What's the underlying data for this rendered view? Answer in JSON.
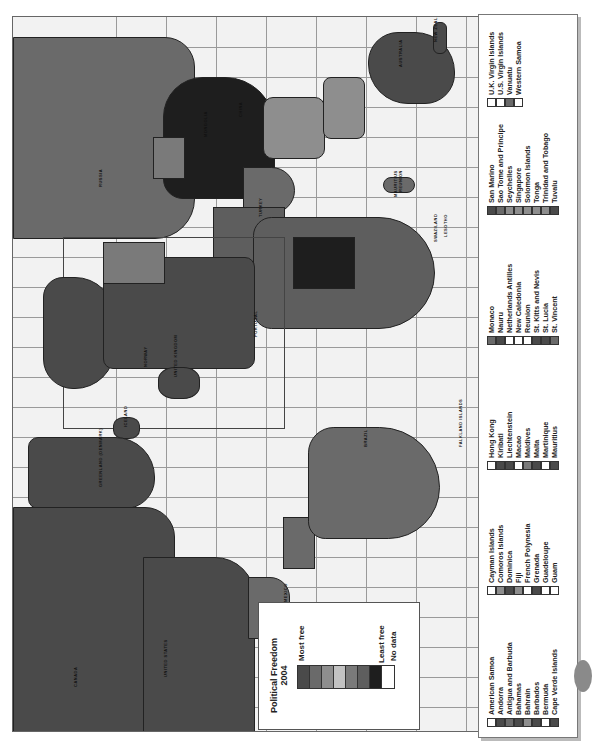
{
  "legend": {
    "title_line1": "Political Freedom",
    "title_line2": "2004",
    "most_free": "Most free",
    "least_free": "Least free",
    "no_data": "No data",
    "scale_colors": [
      "#4a4a4a",
      "#6a6a6a",
      "#8e8e8e",
      "#c2c2c2",
      "#7a7a7a",
      "#5e5e5e",
      "#1e1e1e",
      "#ffffff"
    ]
  },
  "map_labels": [
    {
      "text": "CANADA",
      "x": 60,
      "y": 670
    },
    {
      "text": "UNITED STATES",
      "x": 150,
      "y": 660
    },
    {
      "text": "GREENLAND (DENMARK)",
      "x": 85,
      "y": 470
    },
    {
      "text": "ICELAND",
      "x": 110,
      "y": 410
    },
    {
      "text": "NORWAY",
      "x": 130,
      "y": 350
    },
    {
      "text": "UNITED KINGDOM",
      "x": 160,
      "y": 360
    },
    {
      "text": "PORTUGAL",
      "x": 240,
      "y": 320
    },
    {
      "text": "TURKEY",
      "x": 245,
      "y": 200
    },
    {
      "text": "RUSSIA",
      "x": 85,
      "y": 170
    },
    {
      "text": "CHINA",
      "x": 225,
      "y": 100
    },
    {
      "text": "MONGOLIA",
      "x": 190,
      "y": 120
    },
    {
      "text": "AUSTRALIA",
      "x": 385,
      "y": 50
    },
    {
      "text": "NEW ZEALAND",
      "x": 420,
      "y": 25
    },
    {
      "text": "BRAZIL",
      "x": 350,
      "y": 430
    },
    {
      "text": "MEXICO",
      "x": 270,
      "y": 585
    },
    {
      "text": "FALKLAND ISLANDS",
      "x": 445,
      "y": 430
    },
    {
      "text": "MAURITIUS",
      "x": 380,
      "y": 180
    },
    {
      "text": "REUNION",
      "x": 385,
      "y": 175
    },
    {
      "text": "SWAZILAND",
      "x": 420,
      "y": 225
    },
    {
      "text": "LESOTHO",
      "x": 430,
      "y": 220
    }
  ],
  "country_list": {
    "groups": [
      {
        "items": [
          {
            "name": "American Samoa",
            "color": "#ffffff"
          },
          {
            "name": "Andorra",
            "color": "#4a4a4a"
          },
          {
            "name": "Antigua and Barbuda",
            "color": "#6a6a6a"
          },
          {
            "name": "Bahamas",
            "color": "#4a4a4a"
          },
          {
            "name": "Bahrain",
            "color": "#8e8e8e"
          },
          {
            "name": "Barbados",
            "color": "#4a4a4a"
          },
          {
            "name": "Bermuda",
            "color": "#ffffff"
          },
          {
            "name": "Cape Verde Islands",
            "color": "#4a4a4a"
          }
        ]
      },
      {
        "items": [
          {
            "name": "Cayman Islands",
            "color": "#ffffff"
          },
          {
            "name": "Comoros Islands",
            "color": "#8e8e8e"
          },
          {
            "name": "Dominica",
            "color": "#4a4a4a"
          },
          {
            "name": "Fiji",
            "color": "#8e8e8e"
          },
          {
            "name": "French Polynesia",
            "color": "#ffffff"
          },
          {
            "name": "Grenada",
            "color": "#4a4a4a"
          },
          {
            "name": "Guadeloupe",
            "color": "#ffffff"
          },
          {
            "name": "Guam",
            "color": "#ffffff"
          }
        ]
      },
      {
        "items": [
          {
            "name": "Hong Kong",
            "color": "#ffffff"
          },
          {
            "name": "Kiribati",
            "color": "#4a4a4a"
          },
          {
            "name": "Liechtenstein",
            "color": "#4a4a4a"
          },
          {
            "name": "Macao",
            "color": "#ffffff"
          },
          {
            "name": "Maldives",
            "color": "#7a7a7a"
          },
          {
            "name": "Malta",
            "color": "#4a4a4a"
          },
          {
            "name": "Martinique",
            "color": "#ffffff"
          },
          {
            "name": "Mauritius",
            "color": "#4a4a4a"
          }
        ]
      },
      {
        "items": [
          {
            "name": "Monaco",
            "color": "#6a6a6a"
          },
          {
            "name": "Nauru",
            "color": "#4a4a4a"
          },
          {
            "name": "Netherlands Antilles",
            "color": "#ffffff"
          },
          {
            "name": "New Caledonia",
            "color": "#ffffff"
          },
          {
            "name": "Reunion",
            "color": "#ffffff"
          },
          {
            "name": "St. Kitts and Nevis",
            "color": "#4a4a4a"
          },
          {
            "name": "St. Lucia",
            "color": "#4a4a4a"
          },
          {
            "name": "St. Vincent",
            "color": "#6a6a6a"
          }
        ]
      },
      {
        "items": [
          {
            "name": "San Marino",
            "color": "#4a4a4a"
          },
          {
            "name": "Sao Tome and Principe",
            "color": "#6a6a6a"
          },
          {
            "name": "Seychelles",
            "color": "#8e8e8e"
          },
          {
            "name": "Singapore",
            "color": "#8e8e8e"
          },
          {
            "name": "Solomon Islands",
            "color": "#8e8e8e"
          },
          {
            "name": "Tonga",
            "color": "#8e8e8e"
          },
          {
            "name": "Trinidad and Tobago",
            "color": "#8e8e8e"
          },
          {
            "name": "Tuvalu",
            "color": "#4a4a4a"
          }
        ]
      },
      {
        "items": [
          {
            "name": "U.K. Virgin Islands",
            "color": "#ffffff"
          },
          {
            "name": "U.S. Virgin Islands",
            "color": "#ffffff"
          },
          {
            "name": "Vanuatu",
            "color": "#6a6a6a"
          },
          {
            "name": "Western Samoa",
            "color": "#ffffff"
          }
        ]
      }
    ]
  }
}
